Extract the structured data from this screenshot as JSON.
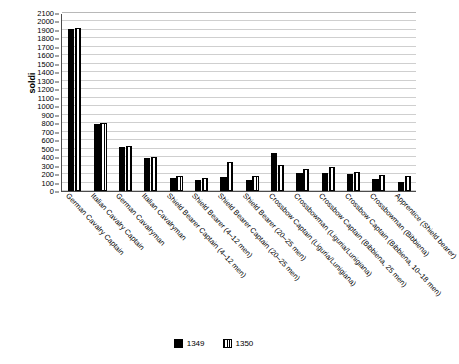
{
  "chart_data": {
    "type": "bar",
    "title": "",
    "xlabel": "",
    "ylabel": "soldi",
    "ylim": [
      0,
      2100
    ],
    "ytick_step": 100,
    "grid": true,
    "legend_position": "bottom",
    "categories": [
      "German Cavalry Captain",
      "Italian Cavalry Captain",
      "German Cavalryman",
      "Italian Cavalryman",
      "Shield Bearer Captain (4–12 men)",
      "Shield Bearer (4–12 men)",
      "Shield Bearer Captain (20–25 men)",
      "Shield Bearer (20–25 men)",
      "Crossbow Captain (Liguria/Lunigiana)",
      "Crossbowman (Liguria/Lunigiana)",
      "Crossbow Captain (Bibbiena, 25 men)",
      "Crossbow Captain (Bibbiena, 10–18 men)",
      "Crossbowman (Bibbiena)",
      "Apprentice (Shield bearer)"
    ],
    "series": [
      {
        "name": "1349",
        "color": "#000000",
        "pattern": "solid",
        "values": [
          1915,
          795,
          520,
          395,
          155,
          130,
          160,
          130,
          450,
          215,
          210,
          205,
          145,
          105
        ]
      },
      {
        "name": "1350",
        "color": "#000000",
        "pattern": "vertical-stripes",
        "values": [
          1920,
          800,
          530,
          400,
          175,
          150,
          340,
          180,
          310,
          255,
          280,
          230,
          185,
          175
        ]
      }
    ],
    "ytick_labels": [
      "0",
      "100",
      "200",
      "300",
      "400",
      "500",
      "600",
      "700",
      "800",
      "900",
      "1000",
      "1100",
      "1200",
      "1300",
      "1400",
      "1500",
      "1600",
      "1700",
      "1800",
      "1900",
      "2000",
      "2100"
    ]
  },
  "legend": {
    "items": [
      {
        "label": "1349"
      },
      {
        "label": "1350"
      }
    ]
  }
}
